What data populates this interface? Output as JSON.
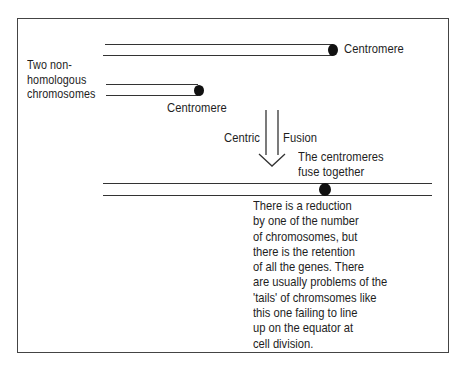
{
  "diagram": {
    "label_two_chromosomes": [
      "Two non-",
      "homologous",
      "chromosomes"
    ],
    "label_centromere_long": "Centromere",
    "label_centromere_short": "Centromere",
    "arrow_left_label": "Centric",
    "arrow_right_label": "Fusion",
    "fuse_label": [
      "The centromeres",
      "fuse together"
    ],
    "explanation_lines": [
      "There is a reduction",
      "by one of the number",
      "of chromosomes, but",
      "there is the retention",
      "of all the genes. There",
      "are usually problems of the",
      "'tails' of chromsomes like",
      "this one failing to line",
      "up on the equator at",
      "cell division."
    ],
    "colors": {
      "line": "#333333",
      "centromere": "#111111",
      "frame": "#444444",
      "text": "#1e1e1e"
    }
  }
}
